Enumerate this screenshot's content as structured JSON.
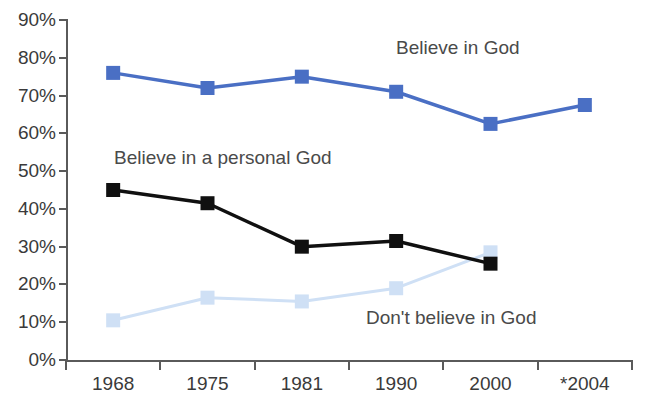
{
  "chart_data": {
    "type": "line",
    "title": "",
    "xlabel": "",
    "ylabel": "",
    "categories": [
      "1968",
      "1975",
      "1981",
      "1990",
      "2000",
      "*2004"
    ],
    "ylim": [
      0,
      90
    ],
    "y_ticks": [
      "0%",
      "10%",
      "20%",
      "30%",
      "40%",
      "50%",
      "60%",
      "70%",
      "80%",
      "90%"
    ],
    "y_tick_values": [
      0,
      10,
      20,
      30,
      40,
      50,
      60,
      70,
      80,
      90
    ],
    "grid": false,
    "legend_position": "inline-annotations",
    "series": [
      {
        "name": "Believe in God",
        "color": "#4a6fc4",
        "marker": "square",
        "x": [
          "1968",
          "1975",
          "1981",
          "1990",
          "2000",
          "*2004"
        ],
        "values": [
          76,
          72,
          75,
          71,
          62.5,
          67.5
        ]
      },
      {
        "name": "Believe in a personal God",
        "color": "#101010",
        "marker": "square",
        "x": [
          "1968",
          "1975",
          "1981",
          "1990",
          "2000"
        ],
        "values": [
          45,
          41.5,
          30,
          31.5,
          25.5
        ]
      },
      {
        "name": "Don't believe in God",
        "color": "#cfe0f5",
        "marker": "square",
        "x": [
          "1968",
          "1975",
          "1981",
          "1990",
          "2000"
        ],
        "values": [
          10.5,
          16.5,
          15.5,
          19,
          28.5
        ]
      }
    ],
    "annotations": [
      {
        "text": "Believe in God",
        "series": "Believe in God"
      },
      {
        "text": "Believe in a personal God",
        "series": "Believe in a personal God"
      },
      {
        "text": "Don't believe in God",
        "series": "Don't believe in God"
      }
    ]
  },
  "axis": {
    "y_labels": [
      "90%",
      "80%",
      "70%",
      "60%",
      "50%",
      "40%",
      "30%",
      "20%",
      "10%",
      "0%"
    ],
    "x_labels": [
      "1968",
      "1975",
      "1981",
      "1990",
      "2000",
      "*2004"
    ]
  },
  "annotations": {
    "believe_in_god": "Believe in God",
    "personal_god": "Believe in a personal God",
    "dont_believe": "Don't believe in God"
  },
  "footnote": ""
}
